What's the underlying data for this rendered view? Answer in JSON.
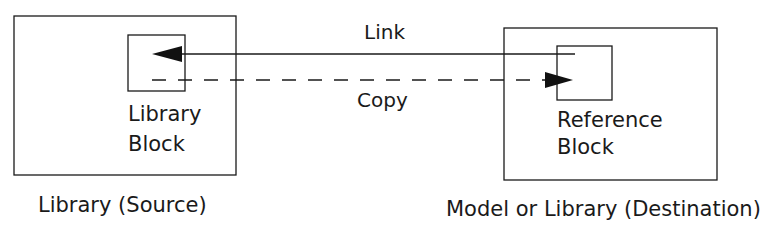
{
  "diagram": {
    "source_container": {
      "label": "Library (Source)",
      "inner_block": {
        "line1": "Library",
        "line2": "Block"
      }
    },
    "destination_container": {
      "label": "Model or Library (Destination)",
      "inner_block": {
        "line1": "Reference",
        "line2": "Block"
      }
    },
    "connections": [
      {
        "label": "Link",
        "from": "Reference Block",
        "to": "Library Block",
        "style": "solid"
      },
      {
        "label": "Copy",
        "from": "Library Block",
        "to": "Reference Block",
        "style": "dashed"
      }
    ],
    "colors": {
      "stroke": "#1a1a1a",
      "background": "#ffffff"
    }
  }
}
